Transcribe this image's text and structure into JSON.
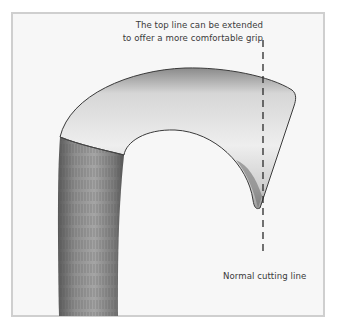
{
  "figure": {
    "annotations": {
      "top_line_1": "The top line can be extended",
      "top_line_2": "to offer a more comfortable grip",
      "cutting_line": "Normal cutting line"
    },
    "colors": {
      "frame_border": "#cfcfcf",
      "frame_background": "#f7f7f7",
      "text": "#3a3a3a",
      "shaft_dark": "#6e6e6e",
      "hook_light": "#e4e4e4",
      "outline": "#333333"
    }
  }
}
